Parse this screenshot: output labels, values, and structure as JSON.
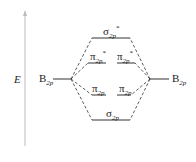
{
  "diagram": {
    "type": "molecular-orbital-diagram",
    "axis_label": "E",
    "atomic_orbitals": {
      "left": {
        "symbol": "B",
        "sub": "2p"
      },
      "right": {
        "symbol": "B",
        "sub": "2p"
      }
    },
    "molecular_orbitals": [
      {
        "id": "sigma2p_star",
        "symbol": "σ",
        "sub": "2p",
        "sup": "*"
      },
      {
        "id": "pi2p_star_a",
        "symbol": "π",
        "sub": "2p",
        "sup": "*"
      },
      {
        "id": "pi2p_star_b",
        "symbol": "π",
        "sub": "2p",
        "sup": "*"
      },
      {
        "id": "pi2p_a",
        "symbol": "π",
        "sub": "2p",
        "sup": ""
      },
      {
        "id": "pi2p_b",
        "symbol": "π",
        "sub": "2p",
        "sup": ""
      },
      {
        "id": "sigma2p",
        "symbol": "σ",
        "sub": "2p",
        "sup": ""
      }
    ],
    "colors": {
      "line": "#333333",
      "axis": "#bbbbbb"
    }
  }
}
